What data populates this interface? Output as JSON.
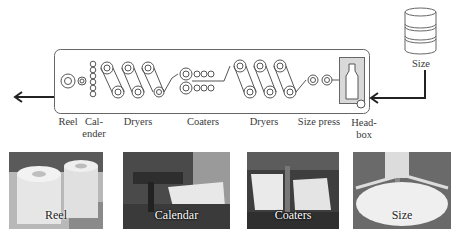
{
  "diagram": {
    "type": "paper-machine-process-flow",
    "tank_label": "Size",
    "sections": [
      {
        "id": "reel",
        "label": "Reel"
      },
      {
        "id": "calender",
        "label_line1": "Cal-",
        "label_line2": "ender"
      },
      {
        "id": "dryers1",
        "label": "Dryers"
      },
      {
        "id": "coaters",
        "label": "Coaters"
      },
      {
        "id": "dryers2",
        "label": "Dryers"
      },
      {
        "id": "size-press",
        "label": "Size press"
      },
      {
        "id": "headbox",
        "label_line1": "Head-",
        "label_line2": "box"
      }
    ],
    "colors": {
      "line": "#555555",
      "arrow": "#222222",
      "headbox_fill": "#d9d9d9"
    }
  },
  "photos": [
    {
      "id": "reel",
      "caption": "Reel"
    },
    {
      "id": "calendar",
      "caption": "Calendar"
    },
    {
      "id": "coaters",
      "caption": "Coaters"
    },
    {
      "id": "size",
      "caption": "Size"
    }
  ]
}
